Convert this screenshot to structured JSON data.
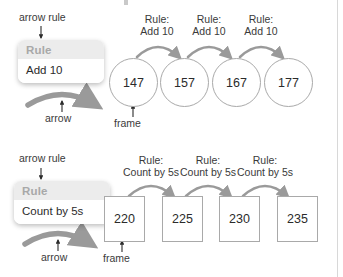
{
  "diagram": {
    "rows": [
      {
        "id": "add-10",
        "callouts": {
          "arrow_rule": "arrow rule",
          "arrow": "arrow",
          "frame": "frame"
        },
        "rule_card": {
          "header": "Rule",
          "body": "Add 10"
        },
        "arrow_labels": [
          {
            "line1": "Rule:",
            "line2": "Add 10"
          },
          {
            "line1": "Rule:",
            "line2": "Add 10"
          },
          {
            "line1": "Rule:",
            "line2": "Add 10"
          }
        ],
        "frames": [
          "147",
          "157",
          "167",
          "177"
        ],
        "frame_shape": "circle"
      },
      {
        "id": "count-by-5s",
        "callouts": {
          "arrow_rule": "arrow rule",
          "arrow": "arrow",
          "frame": "frame"
        },
        "rule_card": {
          "header": "Rule",
          "body": "Count by 5s"
        },
        "arrow_labels": [
          {
            "line1": "Rule:",
            "line2": "Count by 5s"
          },
          {
            "line1": "Rule:",
            "line2": "Count by 5s"
          },
          {
            "line1": "Rule:",
            "line2": "Count by 5s"
          }
        ],
        "frames": [
          "220",
          "225",
          "230",
          "235"
        ],
        "frame_shape": "square"
      }
    ],
    "colors": {
      "arrow_gray": "#9a9a9a",
      "frame_border": "#a9a9a9",
      "card_header_bg": "#ececec",
      "card_header_text": "#a8a8a8",
      "text": "#2b2b2b"
    }
  }
}
